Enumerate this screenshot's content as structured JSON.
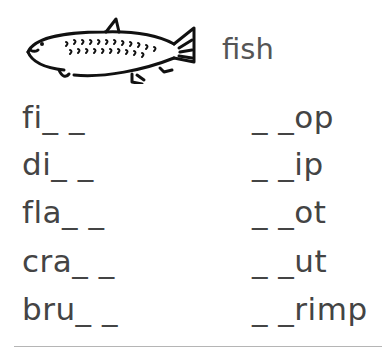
{
  "header": {
    "picture": "fish-drawing",
    "label": "fish"
  },
  "exercise": {
    "left_column": [
      {
        "text": "fi_ _"
      },
      {
        "text": "di_ _"
      },
      {
        "text": "fla_ _"
      },
      {
        "text": "cra_ _"
      },
      {
        "text": "bru_ _"
      }
    ],
    "right_column": [
      {
        "text": "_ _op"
      },
      {
        "text": "_ _ip"
      },
      {
        "text": "_ _ot"
      },
      {
        "text": "_ _ut"
      },
      {
        "text": "_ _rimp"
      }
    ]
  },
  "colors": {
    "text": "#444444",
    "rule": "#b5b5b5",
    "background": "#ffffff"
  }
}
